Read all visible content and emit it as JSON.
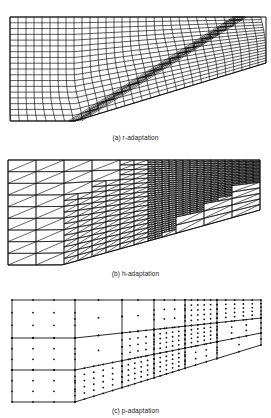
{
  "figure": {
    "panels": [
      {
        "id": "a",
        "caption": "(a) r-adaptation",
        "mesh_type": "structured-quad-r-adapted",
        "outline": [
          [
            10,
            17
          ],
          [
            266,
            17
          ],
          [
            266,
            63
          ],
          [
            75,
            121
          ],
          [
            10,
            121
          ]
        ],
        "grid": {
          "cols": 32,
          "rows": 18
        },
        "shock_line": {
          "from": [
            75,
            121
          ],
          "to": [
            240,
            17
          ]
        },
        "caption_y": 134
      },
      {
        "id": "b",
        "caption": "(b) h-adaptation",
        "mesh_type": "triangular-h-refined",
        "outline": [
          [
            8,
            160
          ],
          [
            260,
            160
          ],
          [
            260,
            210
          ],
          [
            62,
            265
          ],
          [
            8,
            265
          ]
        ],
        "coarse": {
          "cols": 9,
          "rows": 9
        },
        "caption_y": 270
      },
      {
        "id": "c",
        "caption": "(c) p-adaptation",
        "mesh_type": "quad-p-enriched",
        "column_x": [
          12,
          75,
          122,
          154,
          185,
          217,
          261
        ],
        "top_y": 300,
        "row_left_y": [
          300,
          338,
          370,
          402
        ],
        "row_right_y": [
          300,
          318,
          333,
          345
        ],
        "poly_orders": [
          [
            3,
            3,
            3
          ],
          [
            3,
            3,
            3
          ],
          [
            3,
            3,
            5
          ],
          [
            2,
            3,
            4
          ],
          [
            3,
            4,
            5
          ],
          [
            4,
            5,
            6
          ],
          [
            5,
            6,
            7
          ],
          [
            6,
            4,
            3
          ]
        ],
        "orders_by_col_row": [
          [
            3,
            3,
            3
          ],
          [
            2,
            2,
            5
          ],
          [
            2,
            4,
            5
          ],
          [
            3,
            5,
            5
          ],
          [
            5,
            5,
            3
          ],
          [
            5,
            3,
            2
          ]
        ],
        "caption_y": 407
      }
    ]
  }
}
